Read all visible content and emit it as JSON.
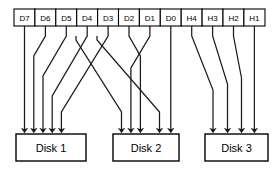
{
  "diagram": {
    "source_row": {
      "name": "source-block-row",
      "cells": [
        {
          "label": "D7",
          "kind": "data",
          "target_disk": 1
        },
        {
          "label": "D6",
          "kind": "data",
          "target_disk": 1
        },
        {
          "label": "D5",
          "kind": "data",
          "target_disk": 1
        },
        {
          "label": "D4",
          "kind": "data",
          "target_disk": 2
        },
        {
          "label": "D3",
          "kind": "data",
          "target_disk": 1
        },
        {
          "label": "D2",
          "kind": "data",
          "target_disk": 2
        },
        {
          "label": "D1",
          "kind": "data",
          "target_disk": 2
        },
        {
          "label": "D0",
          "kind": "data",
          "target_disk": 2
        },
        {
          "label": "H4",
          "kind": "parity",
          "target_disk": 3
        },
        {
          "label": "H3",
          "kind": "parity",
          "target_disk": 3
        },
        {
          "label": "H2",
          "kind": "parity",
          "target_disk": 3
        },
        {
          "label": "H1",
          "kind": "parity",
          "target_disk": 3
        }
      ]
    },
    "disks": [
      {
        "label": "Disk 1",
        "inputs": [
          "D7",
          "D6",
          "D5",
          "D3"
        ]
      },
      {
        "label": "Disk 2",
        "inputs": [
          "D4",
          "D2",
          "D1",
          "D0"
        ]
      },
      {
        "label": "Disk 3",
        "inputs": [
          "H4",
          "H3",
          "H2",
          "H1"
        ]
      }
    ],
    "colors": {
      "stroke": "#000000",
      "wire": "#1a1a1a",
      "background": "#ffffff",
      "fill": "#ffffff"
    },
    "arrow_count_per_disk": 4,
    "total_sources": 12
  }
}
